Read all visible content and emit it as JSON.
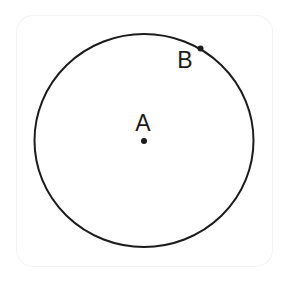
{
  "diagram": {
    "type": "circle-with-center-and-point",
    "circle": {
      "cx": 144,
      "cy": 140.5,
      "rx": 109.5,
      "ry": 106.5,
      "stroke": "#1c1c1c",
      "stroke_width": 2
    },
    "points": [
      {
        "id": "A",
        "label": "A",
        "x": 144,
        "y": 141,
        "label_x": 143,
        "label_y": 131,
        "role": "center"
      },
      {
        "id": "B",
        "label": "B",
        "x": 200.5,
        "y": 48.5,
        "label_x": 185,
        "label_y": 68,
        "role": "on-circle"
      }
    ],
    "colors": {
      "line": "#1c1c1c",
      "background": "#ffffff",
      "frame_border": "#f3f3f3"
    }
  }
}
